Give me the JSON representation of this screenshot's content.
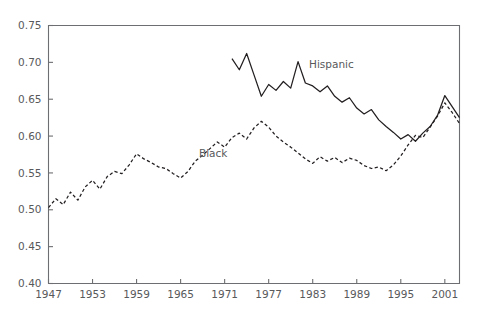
{
  "chart_data": {
    "type": "line",
    "title": "",
    "subtitle": "",
    "xlabel": "",
    "ylabel": "",
    "xlim": [
      1947,
      2003
    ],
    "ylim": [
      0.4,
      0.75
    ],
    "grid": false,
    "legend_position": "inline-annotation",
    "xticks": [
      1947,
      1953,
      1959,
      1965,
      1971,
      1977,
      1983,
      1989,
      1995,
      2001
    ],
    "xtick_labels": [
      "1947",
      "1953",
      "1959",
      "1965",
      "1971",
      "1977",
      "1983",
      "1989",
      "1995",
      "2001"
    ],
    "yticks": [
      0.4,
      0.45,
      0.5,
      0.55,
      0.6,
      0.65,
      0.7,
      0.75
    ],
    "ytick_labels": [
      "0.40",
      "0.45",
      "0.50",
      "0.55",
      "0.60",
      "0.65",
      "0.70",
      "0.75"
    ],
    "annotations": [
      {
        "text": "Black",
        "x": 1967.5,
        "y": 0.572,
        "name": "black-series-label"
      },
      {
        "text": "Hispanic",
        "x": 1982.5,
        "y": 0.693,
        "name": "hispanic-series-label"
      }
    ],
    "series": [
      {
        "name": "Black",
        "style": "dashed",
        "color": "#231f20",
        "x": [
          1947,
          1948,
          1949,
          1950,
          1951,
          1952,
          1953,
          1954,
          1955,
          1956,
          1957,
          1958,
          1959,
          1960,
          1961,
          1962,
          1963,
          1964,
          1965,
          1966,
          1967,
          1968,
          1969,
          1970,
          1971,
          1972,
          1973,
          1974,
          1975,
          1976,
          1977,
          1978,
          1979,
          1980,
          1981,
          1982,
          1983,
          1984,
          1985,
          1986,
          1987,
          1988,
          1989,
          1990,
          1991,
          1992,
          1993,
          1994,
          1995,
          1996,
          1997,
          1998,
          1999,
          2000,
          2001,
          2002,
          2003
        ],
        "values": [
          0.503,
          0.515,
          0.507,
          0.524,
          0.513,
          0.531,
          0.54,
          0.528,
          0.545,
          0.552,
          0.549,
          0.561,
          0.576,
          0.569,
          0.564,
          0.558,
          0.556,
          0.549,
          0.543,
          0.552,
          0.566,
          0.574,
          0.583,
          0.592,
          0.585,
          0.598,
          0.604,
          0.596,
          0.611,
          0.62,
          0.612,
          0.6,
          0.592,
          0.585,
          0.577,
          0.569,
          0.563,
          0.572,
          0.566,
          0.571,
          0.564,
          0.57,
          0.567,
          0.56,
          0.556,
          0.558,
          0.553,
          0.561,
          0.573,
          0.588,
          0.601,
          0.598,
          0.612,
          0.627,
          0.645,
          0.632,
          0.617
        ]
      },
      {
        "name": "Hispanic",
        "style": "solid",
        "color": "#231f20",
        "x": [
          1972,
          1973,
          1974,
          1975,
          1976,
          1977,
          1978,
          1979,
          1980,
          1981,
          1982,
          1983,
          1984,
          1985,
          1986,
          1987,
          1988,
          1989,
          1990,
          1991,
          1992,
          1993,
          1994,
          1995,
          1996,
          1997,
          1998,
          1999,
          2000,
          2001,
          2002,
          2003
        ],
        "values": [
          0.705,
          0.69,
          0.712,
          0.683,
          0.654,
          0.67,
          0.662,
          0.674,
          0.665,
          0.701,
          0.672,
          0.668,
          0.66,
          0.668,
          0.654,
          0.646,
          0.652,
          0.638,
          0.63,
          0.636,
          0.622,
          0.613,
          0.605,
          0.596,
          0.602,
          0.593,
          0.604,
          0.613,
          0.628,
          0.655,
          0.64,
          0.625
        ]
      }
    ]
  },
  "axes": {
    "frame_color": "#6d6e71",
    "tick_color": "#6d6e71"
  }
}
